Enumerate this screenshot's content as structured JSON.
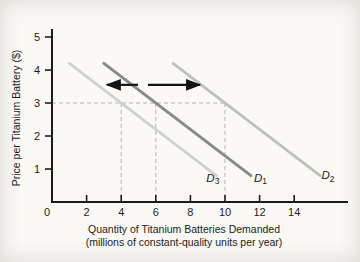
{
  "figure": {
    "bg": "#faf9f6",
    "axis_color": "#1c1c1c",
    "text_color": "#1c1c1c",
    "guide_color": "#b3b3b3",
    "arrow_color": "#141414"
  },
  "chart_data": {
    "type": "line",
    "title": "",
    "ylabel": "Price per Titanium Battery ($)",
    "xlabel": "Quantity of Titanium Batteries Demanded",
    "xlabel_sub": "(millions of constant-quality units per year)",
    "xlim": [
      0,
      17.1
    ],
    "ylim": [
      0,
      5.24
    ],
    "grid": "off",
    "x_ticks": [
      0,
      2,
      4,
      6,
      8,
      10,
      12,
      14
    ],
    "y_ticks": [
      1,
      2,
      3,
      4,
      5
    ],
    "series": [
      {
        "name": "D3",
        "label_base": "D",
        "label_sub": "3",
        "color": "#d0d0d0",
        "stroke_width": 2.7,
        "points": [
          [
            1,
            4.2
          ],
          [
            9.5,
            0.8
          ]
        ],
        "label_at": [
          9.3,
          0.62
        ]
      },
      {
        "name": "D1",
        "label_base": "D",
        "label_sub": "1",
        "color": "#8a8a8a",
        "stroke_width": 3.0,
        "points": [
          [
            3,
            4.2
          ],
          [
            11.5,
            0.8
          ]
        ],
        "label_at": [
          12.05,
          0.62
        ]
      },
      {
        "name": "D2",
        "label_base": "D",
        "label_sub": "2",
        "color": "#bfbfbf",
        "stroke_width": 2.7,
        "points": [
          [
            7,
            4.2
          ],
          [
            15.5,
            0.8
          ]
        ],
        "label_at": [
          15.95,
          0.7
        ]
      }
    ],
    "guide_price": 3,
    "guide_h_to_q": 10,
    "guide_verticals_q": [
      4,
      6,
      10
    ],
    "shift_arrows": [
      {
        "name": "leftward-shift",
        "from_q": 4.97,
        "to_q": 3.18,
        "price": 3.55
      },
      {
        "name": "rightward-shift",
        "from_q": 5.55,
        "to_q": 8.55,
        "price": 3.55
      }
    ]
  }
}
